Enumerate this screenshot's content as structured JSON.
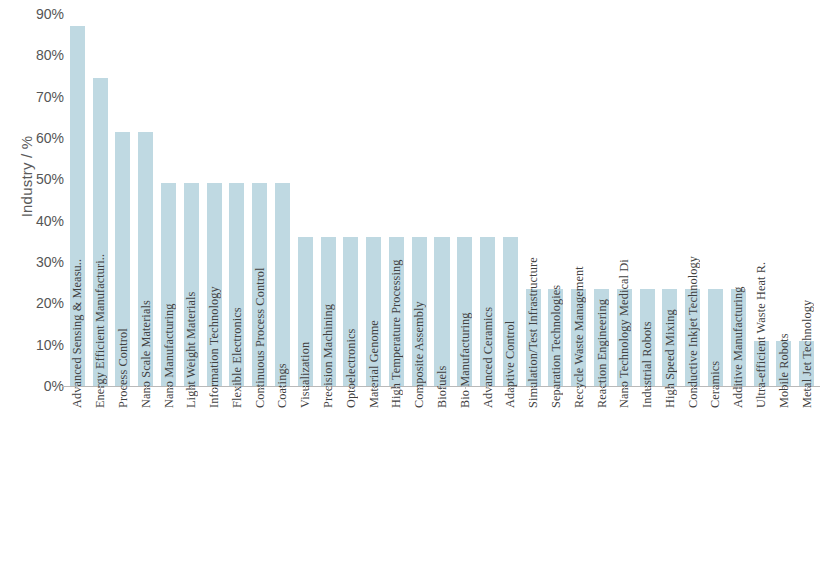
{
  "chart_data": {
    "type": "bar",
    "title": "",
    "subtitle": "",
    "xlabel": "",
    "ylabel": "Industry / %",
    "ylim": [
      0,
      90
    ],
    "ytick_labels": [
      "90%",
      "80%",
      "70%",
      "60%",
      "50%",
      "40%",
      "30%",
      "20%",
      "10%",
      "0%"
    ],
    "ytick_values": [
      90,
      80,
      70,
      60,
      50,
      40,
      30,
      20,
      10,
      0
    ],
    "grid": false,
    "legend": null,
    "bar_color": "#bfd9e2",
    "categories": [
      "Advanced Sensing & Measu..",
      "Energy Efficient Manufacturi..",
      "Process Control",
      "Nano Scale Materials",
      "Nano Manufacturing",
      "Light Weight Materials",
      "Information Technology",
      "Flexible Electronics",
      "Continuous Process Control",
      "Coatings",
      "Visualization",
      "Precision Machining",
      "Optoelectronics",
      "Material Genome",
      "High Temperature Processing",
      "Composite Assembly",
      "Biofuels",
      "Bio Manufacturing",
      "Advanced Ceramics",
      "Adaptive Control",
      "Simulation/Test Infrastructure",
      "Separation Technologies",
      "Recycle Waste Management",
      "Reaction Engineering",
      "Nano Technology Medical Di",
      "Industrial Robots",
      "High Speed Mixing",
      "Conductive Inkjet Technology",
      "Ceramics",
      "Additive Manufacturing",
      "Ultra-efficient Waste Heat R.",
      "Mobile Robots",
      "Metal Jet Technology"
    ],
    "values": [
      87,
      74.5,
      61.5,
      61.5,
      49,
      49,
      49,
      49,
      49,
      49,
      36,
      36,
      36,
      36,
      36,
      36,
      36,
      36,
      36,
      36,
      23.5,
      23.5,
      23.5,
      23.5,
      23.5,
      23.5,
      23.5,
      23.5,
      23.5,
      23.5,
      11,
      11,
      11
    ]
  }
}
